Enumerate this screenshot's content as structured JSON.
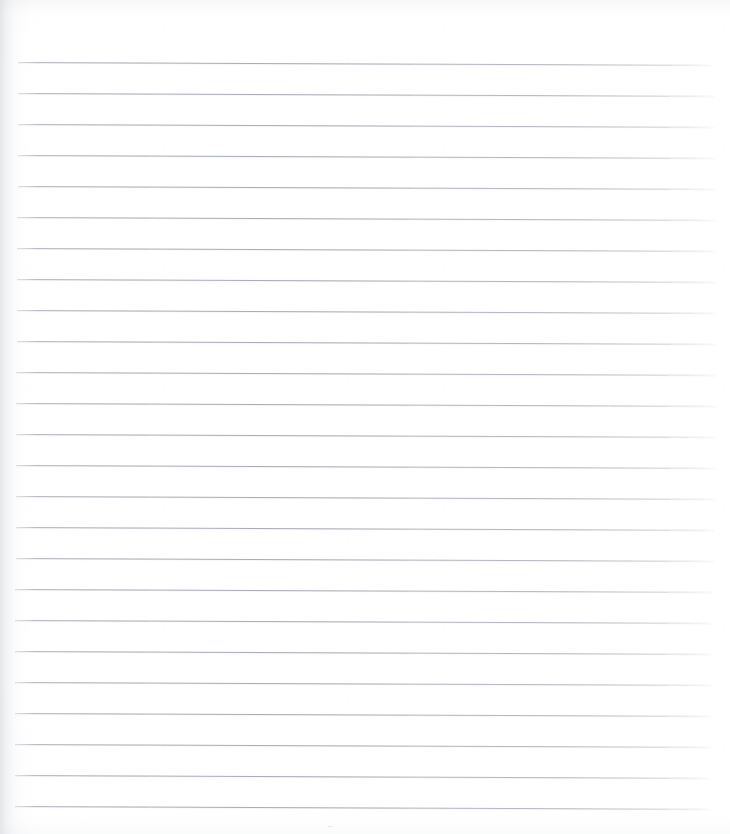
{
  "document": {
    "kind": "scanned-blank-lined-page",
    "page_width": 730,
    "page_height": 834,
    "background_color": "#ffffff",
    "body_text": "",
    "headings": [],
    "captions": [],
    "page_number_artifact": ".."
  },
  "ruling": {
    "line_color": "#a8adb5",
    "line_thickness_px": 1,
    "line_count": 25,
    "first_line_y": 62,
    "line_spacing_px": 31,
    "left_margin_x": 18,
    "right_margin_x": 713,
    "skew_degrees": 0.22,
    "lines": [
      {
        "index": 1,
        "y": 62,
        "x_start": 18,
        "x_end": 713
      },
      {
        "index": 2,
        "y": 93,
        "x_start": 18,
        "x_end": 714
      },
      {
        "index": 3,
        "y": 124,
        "x_start": 18,
        "x_end": 714
      },
      {
        "index": 4,
        "y": 155,
        "x_start": 18,
        "x_end": 715
      },
      {
        "index": 5,
        "y": 186,
        "x_start": 18,
        "x_end": 715
      },
      {
        "index": 6,
        "y": 217,
        "x_start": 17,
        "x_end": 715
      },
      {
        "index": 7,
        "y": 248,
        "x_start": 17,
        "x_end": 716
      },
      {
        "index": 8,
        "y": 279,
        "x_start": 17,
        "x_end": 716
      },
      {
        "index": 9,
        "y": 310,
        "x_start": 17,
        "x_end": 716
      },
      {
        "index": 10,
        "y": 341,
        "x_start": 17,
        "x_end": 716
      },
      {
        "index": 11,
        "y": 372,
        "x_start": 16,
        "x_end": 716
      },
      {
        "index": 12,
        "y": 403,
        "x_start": 16,
        "x_end": 716
      },
      {
        "index": 13,
        "y": 434,
        "x_start": 16,
        "x_end": 715
      },
      {
        "index": 14,
        "y": 465,
        "x_start": 16,
        "x_end": 715
      },
      {
        "index": 15,
        "y": 496,
        "x_start": 16,
        "x_end": 715
      },
      {
        "index": 16,
        "y": 527,
        "x_start": 16,
        "x_end": 714
      },
      {
        "index": 17,
        "y": 558,
        "x_start": 16,
        "x_end": 714
      },
      {
        "index": 18,
        "y": 589,
        "x_start": 15,
        "x_end": 713
      },
      {
        "index": 19,
        "y": 620,
        "x_start": 15,
        "x_end": 713
      },
      {
        "index": 20,
        "y": 651,
        "x_start": 15,
        "x_end": 712
      },
      {
        "index": 21,
        "y": 682,
        "x_start": 15,
        "x_end": 712
      },
      {
        "index": 22,
        "y": 713,
        "x_start": 15,
        "x_end": 711
      },
      {
        "index": 23,
        "y": 744,
        "x_start": 15,
        "x_end": 711
      },
      {
        "index": 24,
        "y": 775,
        "x_start": 15,
        "x_end": 710
      },
      {
        "index": 25,
        "y": 806,
        "x_start": 15,
        "x_end": 710
      }
    ]
  },
  "artifacts": {
    "gutter_shadow": {
      "edge": "left",
      "width_px": 34,
      "color": "#a8acb2"
    },
    "page_number_smudge": {
      "text": "..",
      "x": 328,
      "y": 821,
      "color": "#b0b4ba"
    }
  }
}
